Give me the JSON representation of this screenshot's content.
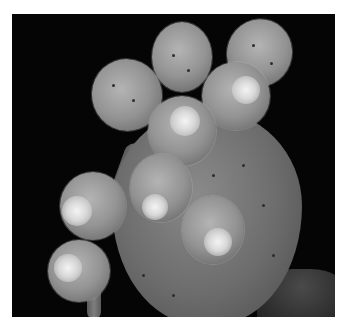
{
  "image": {
    "description": "Grayscale photograph of a prickly pear cactus pad with eight round spiny fruits against a black background, framed by a white border",
    "alt": "Prickly pear cactus with fruits",
    "colors": {
      "border": "#ffffff",
      "background": "#050505",
      "pad": "#6c6c6c",
      "fruit": "#939393",
      "fruit_tip": "#e8e8e8",
      "areole": "#2c2c2c"
    }
  }
}
